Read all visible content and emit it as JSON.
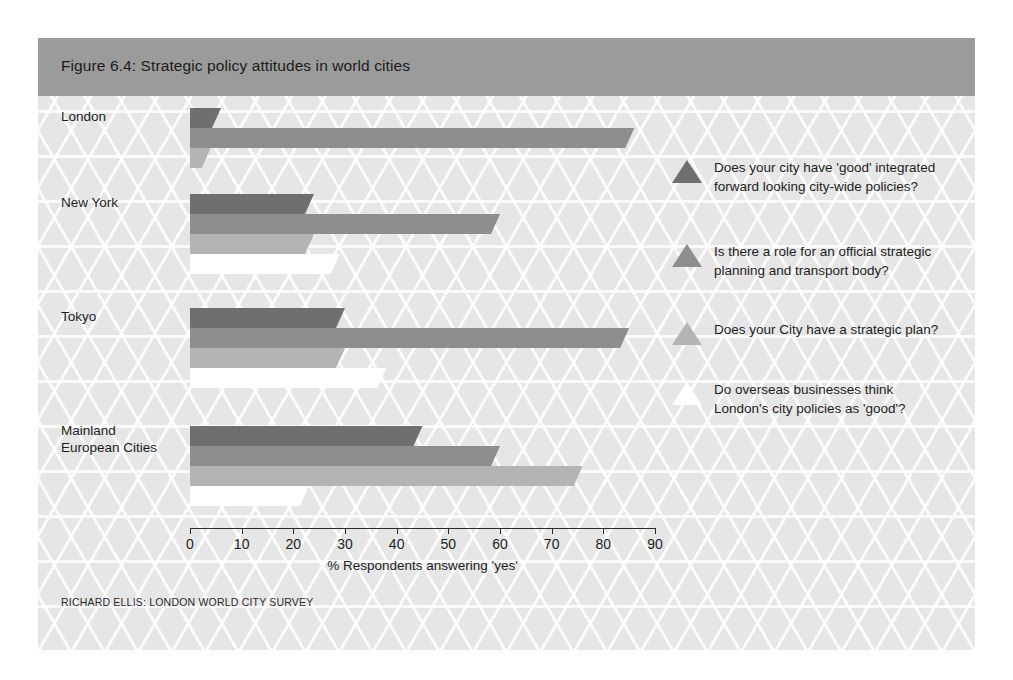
{
  "figure": {
    "title": "Figure 6.4: Strategic policy attitudes in world cities",
    "source": "RICHARD ELLIS: LONDON WORLD CITY SURVEY"
  },
  "chart_data": {
    "type": "bar",
    "orientation": "horizontal",
    "title": "Figure 6.4: Strategic policy attitudes in world cities",
    "subtitle": "",
    "xlabel": "% Respondents answering 'yes'",
    "ylabel": "",
    "xlim": [
      0,
      90
    ],
    "xticks": [
      0,
      10,
      20,
      30,
      40,
      50,
      60,
      70,
      80,
      90
    ],
    "xtick_labels": [
      "0",
      "10",
      "20",
      "30",
      "40",
      "50",
      "60",
      "70",
      "80",
      "90"
    ],
    "grid": false,
    "legend_position": "right",
    "categories": [
      "London",
      "New York",
      "Tokyo",
      "Mainland European Cities"
    ],
    "series": [
      {
        "name": "Does your city have 'good' integrated forward looking city-wide policies?",
        "color": "#6f6f6f",
        "values": [
          6,
          24,
          30,
          45
        ]
      },
      {
        "name": "Is there a role for an official strategic planning and transport body?",
        "color": "#8e8e8e",
        "values": [
          86,
          60,
          85,
          60
        ]
      },
      {
        "name": "Does your City have a strategic plan?",
        "color": "#b4b4b4",
        "values": [
          4,
          24,
          30,
          76
        ]
      },
      {
        "name": "Do overseas businesses think London's city policies as 'good'?",
        "color": "#ffffff",
        "values": [
          0,
          29,
          38,
          23
        ]
      }
    ]
  },
  "legend": {
    "items": [
      {
        "label_line1": "Does your city have 'good' integrated",
        "label_line2": "forward looking city-wide policies?",
        "color": "#6f6f6f",
        "marker": "triangle-marker"
      },
      {
        "label_line1": "Is there a role for an official strategic",
        "label_line2": "planning and transport body?",
        "color": "#8e8e8e",
        "marker": "triangle-marker"
      },
      {
        "label_line1": "Does your City have a strategic plan?",
        "label_line2": "",
        "color": "#b4b4b4",
        "marker": "triangle-marker"
      },
      {
        "label_line1": "Do overseas businesses think",
        "label_line2": "London's city policies as 'good'?",
        "color": "#ffffff",
        "marker": "triangle-marker"
      }
    ]
  },
  "colors": {
    "background": "#e6e6e6",
    "title_band": "#9b9b9b",
    "axis": "#2b2b2b",
    "text": "#1d1d1d"
  }
}
